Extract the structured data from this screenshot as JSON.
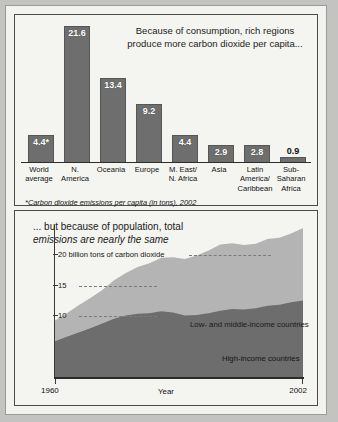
{
  "chart_data": [
    {
      "type": "bar",
      "title": "Because of consumption, rich regions produce more carbon dioxide per capita...",
      "title_line1": "Because of consumption, rich regions",
      "title_line2": "produce more carbon dioxide per capita...",
      "footnote": "*Carbon dioxide emissions per capita (in tons), 2002",
      "xlabel": "",
      "ylabel": "",
      "ylim": [
        0,
        22
      ],
      "grid": false,
      "categories": [
        "World average",
        "N. America",
        "Oceania",
        "Europe",
        "M. East/ N. Africa",
        "Asia",
        "Latin America/ Caribbean",
        "Sub- Saharan Africa"
      ],
      "category_lines": [
        [
          "World",
          "average"
        ],
        [
          "N.",
          "America"
        ],
        [
          "Oceania"
        ],
        [
          "Europe"
        ],
        [
          "M. East/",
          "N. Africa"
        ],
        [
          "Asia"
        ],
        [
          "Latin",
          "America/",
          "Caribbean"
        ],
        [
          "Sub-",
          "Saharan",
          "Africa"
        ]
      ],
      "values": [
        4.4,
        21.6,
        13.4,
        9.2,
        4.4,
        2.9,
        2.8,
        0.9
      ],
      "value_labels": [
        "4.4*",
        "21.6",
        "13.4",
        "9.2",
        "4.4",
        "2.9",
        "2.8",
        "0.9"
      ],
      "bar_color": "#6e6e6e"
    },
    {
      "type": "area",
      "title": "... but because of population, total emissions are nearly the same",
      "title_line1": "... but because of population, total",
      "title_line2": "emissions are nearly the same",
      "xlabel": "Year",
      "ylabel": "billion tons of carbon dioxide",
      "xlim": [
        1960,
        2002
      ],
      "ylim": [
        0,
        25
      ],
      "xticks": [
        "1960",
        "2002"
      ],
      "yticks": [
        {
          "value": 20,
          "label": "20 billion tons of carbon dioxide"
        },
        {
          "value": 15,
          "label": "15"
        },
        {
          "value": 10,
          "label": "10"
        }
      ],
      "grid": true,
      "legend_position": "inside",
      "x": [
        1960,
        1962,
        1964,
        1966,
        1968,
        1970,
        1972,
        1974,
        1976,
        1978,
        1980,
        1982,
        1984,
        1986,
        1988,
        1990,
        1992,
        1994,
        1996,
        1998,
        2000,
        2002
      ],
      "series": [
        {
          "name": "High-income countries",
          "color": "#6d6d6d",
          "values": [
            5.9,
            6.6,
            7.3,
            8.0,
            8.8,
            9.6,
            10.1,
            10.4,
            10.5,
            10.8,
            10.6,
            10.1,
            10.2,
            10.5,
            10.9,
            11.2,
            11.1,
            11.3,
            11.7,
            11.9,
            12.3,
            12.6
          ]
        },
        {
          "name": "Low- and middle-income countries",
          "color": "#b4b4b4",
          "values": [
            3.4,
            3.9,
            4.5,
            5.0,
            5.5,
            6.3,
            7.0,
            7.7,
            8.2,
            8.8,
            9.1,
            9.3,
            9.8,
            10.3,
            10.9,
            10.8,
            10.6,
            10.6,
            11.0,
            11.0,
            11.3,
            11.9
          ]
        }
      ],
      "totals": [
        9.3,
        10.5,
        11.8,
        13.0,
        14.3,
        15.9,
        17.1,
        18.1,
        18.7,
        19.6,
        19.7,
        19.4,
        20.0,
        20.8,
        21.8,
        22.0,
        21.7,
        21.9,
        22.7,
        22.9,
        23.6,
        24.5
      ]
    }
  ],
  "bar_chart": {
    "title_line1": "Because of consumption, rich regions",
    "title_line2": "produce more carbon dioxide per capita...",
    "footnote": "*Carbon dioxide emissions per capita (in tons), 2002"
  },
  "area_chart": {
    "title_line1": "... but because of population, total",
    "title_line2": "emissions are nearly the same",
    "ytick_20": "20 billion tons of carbon dioxide",
    "ytick_15": "15",
    "ytick_10": "10",
    "legend_low": "Low- and middle-income countries",
    "legend_high": "High-income countries",
    "x_start": "1960",
    "x_end": "2002",
    "x_axis_name": "Year"
  }
}
